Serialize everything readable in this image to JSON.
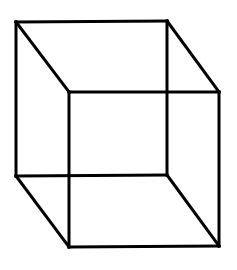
{
  "diagram": {
    "background": "#ffffff",
    "stroke_color": "#000000",
    "stroke_width": 3,
    "vertices": {
      "back_top_left": [
        16,
        22
      ],
      "back_top_right": [
        167,
        21
      ],
      "back_bottom_left": [
        16,
        176
      ],
      "back_bottom_right": [
        167,
        175
      ],
      "front_top_left": [
        69,
        92
      ],
      "front_top_right": [
        219,
        92
      ],
      "front_bottom_left": [
        69,
        247
      ],
      "front_bottom_right": [
        219,
        246
      ]
    },
    "edges": [
      {
        "name": "back-top-edge",
        "from": "back_top_left",
        "to": "back_top_right"
      },
      {
        "name": "back-bottom-edge",
        "from": "back_bottom_left",
        "to": "back_bottom_right"
      },
      {
        "name": "back-left-edge",
        "from": "back_top_left",
        "to": "back_bottom_left"
      },
      {
        "name": "back-right-edge",
        "from": "back_top_right",
        "to": "back_bottom_right"
      },
      {
        "name": "front-top-edge",
        "from": "front_top_left",
        "to": "front_top_right"
      },
      {
        "name": "front-bottom-edge",
        "from": "front_bottom_left",
        "to": "front_bottom_right"
      },
      {
        "name": "front-left-edge",
        "from": "front_top_left",
        "to": "front_bottom_left"
      },
      {
        "name": "front-right-edge",
        "from": "front_top_right",
        "to": "front_bottom_right"
      },
      {
        "name": "connector-top-left",
        "from": "back_top_left",
        "to": "front_top_left"
      },
      {
        "name": "connector-top-right",
        "from": "back_top_right",
        "to": "front_top_right"
      },
      {
        "name": "connector-bottom-left",
        "from": "back_bottom_left",
        "to": "front_bottom_left"
      },
      {
        "name": "connector-bottom-right",
        "from": "back_bottom_right",
        "to": "front_bottom_right"
      }
    ]
  }
}
